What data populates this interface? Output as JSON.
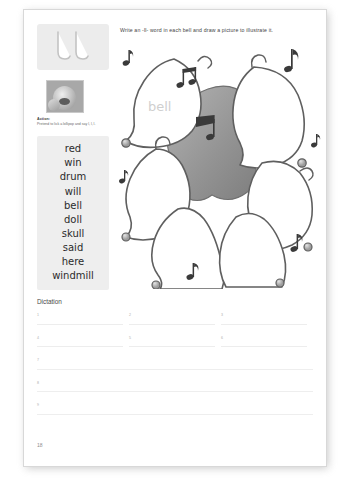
{
  "page": {
    "number": "18"
  },
  "phonics": {
    "letter_tile": "ll",
    "action_label": "Action:",
    "action_text": "Pretend to lick a lollipop and say l, l, l.",
    "photo_alt": "action-photo"
  },
  "word_list": {
    "words": [
      "red",
      "win",
      "drum",
      "will",
      "bell",
      "doll",
      "skull",
      "said",
      "here",
      "windmill"
    ]
  },
  "instruction": {
    "text": "Write an -ll- word in each bell and draw a picture to illustrate it."
  },
  "illustration": {
    "sample_word": "bell",
    "bell_count": 6,
    "note_count": 8,
    "description": "six-bells-cluster"
  },
  "dictation": {
    "title": "Dictation",
    "items_grid": [
      "1",
      "2",
      "3",
      "4",
      "5",
      "6"
    ],
    "items_full": [
      "7",
      "8",
      "9"
    ]
  },
  "colors": {
    "page_background": "#ffffff",
    "panel_gray": "#eeeeee",
    "tile_gray": "#ececec",
    "rule_line": "#ededed",
    "text_dark": "#2b2b2b",
    "text_muted": "#6a6a6a",
    "number_gray": "#aeaeae"
  }
}
